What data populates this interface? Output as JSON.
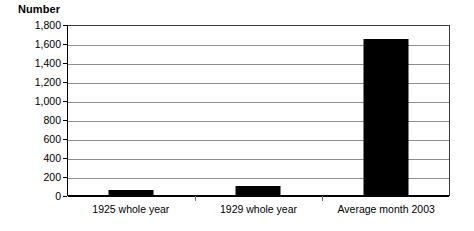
{
  "chart_data": {
    "type": "bar",
    "title": "",
    "subtitle": "",
    "xlabel": "",
    "ylabel": "Number",
    "categories": [
      "1925 whole year",
      "1929 whole year",
      "Average month 2003"
    ],
    "values": [
      65,
      105,
      1650
    ],
    "series": [
      {
        "name": "Number",
        "values": [
          65,
          105,
          1650
        ]
      }
    ],
    "ylim": [
      0,
      1800
    ],
    "ytick_step": 200,
    "ytick_labels": [
      "0",
      "200",
      "400",
      "600",
      "800",
      "1,000",
      "1,200",
      "1,400",
      "1,600",
      "1,800"
    ],
    "ytick_values": [
      0,
      200,
      400,
      600,
      800,
      1000,
      1200,
      1400,
      1600,
      1800
    ],
    "grid": true,
    "grid_axis": "y",
    "legend": false,
    "legend_position": "none",
    "bar_color": "#000000",
    "gridline_color": "#8d8d8d",
    "axis_color": "#000000",
    "background_color": "#ffffff",
    "annotations": []
  }
}
